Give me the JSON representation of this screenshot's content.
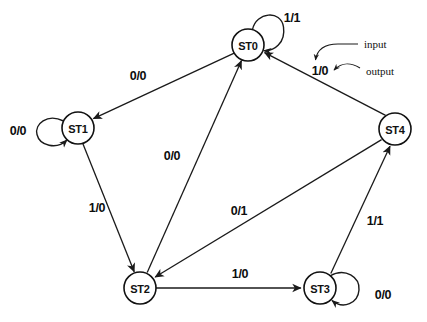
{
  "diagram": {
    "type": "finite-state-machine",
    "title": "",
    "width": 427,
    "height": 322,
    "background": "#ffffff",
    "stroke_color": "#1a1a1a",
    "label_color": "#0d0d0d"
  },
  "states": [
    {
      "id": "ST0",
      "label": "ST0",
      "cx": 248,
      "cy": 45,
      "r": 16
    },
    {
      "id": "ST1",
      "label": "ST1",
      "cx": 78,
      "cy": 128,
      "r": 16
    },
    {
      "id": "ST4",
      "label": "ST4",
      "cx": 395,
      "cy": 129,
      "r": 16
    },
    {
      "id": "ST2",
      "label": "ST2",
      "cx": 140,
      "cy": 288,
      "r": 16
    },
    {
      "id": "ST3",
      "label": "ST3",
      "cx": 320,
      "cy": 288,
      "r": 16
    }
  ],
  "transitions": [
    {
      "from": "ST0",
      "to": "ST0",
      "input": "1",
      "output": "1",
      "label": "1/1",
      "label_x": 292,
      "label_y": 18,
      "kind": "self-loop"
    },
    {
      "from": "ST0",
      "to": "ST1",
      "input": "0",
      "output": "0",
      "label": "0/0",
      "label_x": 138,
      "label_y": 76,
      "kind": "edge"
    },
    {
      "from": "ST1",
      "to": "ST1",
      "input": "0",
      "output": "0",
      "label": "0/0",
      "label_x": 18,
      "label_y": 131,
      "kind": "self-loop"
    },
    {
      "from": "ST1",
      "to": "ST2",
      "input": "1",
      "output": "0",
      "label": "1/0",
      "label_x": 97,
      "label_y": 208,
      "kind": "edge"
    },
    {
      "from": "ST2",
      "to": "ST0",
      "input": "0",
      "output": "0",
      "label": "0/0",
      "label_x": 172,
      "label_y": 156,
      "kind": "edge"
    },
    {
      "from": "ST2",
      "to": "ST3",
      "input": "1",
      "output": "0",
      "label": "1/0",
      "label_x": 240,
      "label_y": 274,
      "kind": "edge"
    },
    {
      "from": "ST3",
      "to": "ST3",
      "input": "0",
      "output": "0",
      "label": "0/0",
      "label_x": 383,
      "label_y": 295,
      "kind": "self-loop"
    },
    {
      "from": "ST3",
      "to": "ST4",
      "input": "1",
      "output": "1",
      "label": "1/1",
      "label_x": 375,
      "label_y": 221,
      "kind": "edge"
    },
    {
      "from": "ST4",
      "to": "ST2",
      "input": "0",
      "output": "1",
      "label": "0/1",
      "label_x": 239,
      "label_y": 211,
      "kind": "edge"
    },
    {
      "from": "ST4",
      "to": "ST0",
      "input": "1",
      "output": "0",
      "label": "1/0",
      "label_x": 320,
      "label_y": 71,
      "kind": "edge"
    }
  ],
  "annotations": [
    {
      "id": "input",
      "label": "input",
      "label_x": 364,
      "label_y": 44,
      "target": "1/0",
      "points_to": "input-digit"
    },
    {
      "id": "output",
      "label": "output",
      "label_x": 366,
      "label_y": 71,
      "target": "1/0",
      "points_to": "output-digit"
    }
  ]
}
